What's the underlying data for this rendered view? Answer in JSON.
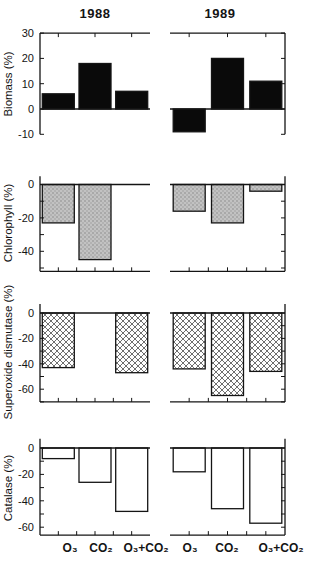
{
  "chart_data": {
    "type": "bar",
    "title": "",
    "columns": [
      "1988",
      "1989"
    ],
    "categories": [
      "O₃",
      "CO₂",
      "O₃+CO₂"
    ],
    "grid": false,
    "legend": null,
    "ink_color": "#141414",
    "rows": [
      {
        "ylabel": "Biomass (%)",
        "ylim": [
          -10,
          30
        ],
        "yticks": [
          30,
          20,
          10,
          0,
          -10
        ],
        "fill": "solid-black",
        "series": [
          {
            "name": "1988",
            "values": [
              6,
              18,
              7
            ]
          },
          {
            "name": "1989",
            "values": [
              -9,
              20,
              11
            ]
          }
        ]
      },
      {
        "ylabel": "Chlorophyll (%)",
        "ylim": [
          -52,
          5
        ],
        "yticks": [
          0,
          -20,
          -40
        ],
        "fill": "stipple-gray",
        "series": [
          {
            "name": "1988",
            "values": [
              -23,
              -45,
              0
            ]
          },
          {
            "name": "1989",
            "values": [
              -16,
              -23,
              -4
            ]
          }
        ]
      },
      {
        "ylabel": "Superoxide dismutase (%)",
        "ylim": [
          -70,
          7
        ],
        "yticks": [
          0,
          -20,
          -40,
          -60
        ],
        "fill": "crosshatch",
        "series": [
          {
            "name": "1988",
            "values": [
              -43,
              0,
              -47
            ]
          },
          {
            "name": "1989",
            "values": [
              -44,
              -65,
              -46
            ]
          }
        ]
      },
      {
        "ylabel": "Catalase (%)",
        "ylim": [
          -66,
          7
        ],
        "yticks": [
          0,
          -20,
          -40,
          -60
        ],
        "fill": "open-white",
        "series": [
          {
            "name": "1988",
            "values": [
              -8,
              -26,
              -48
            ]
          },
          {
            "name": "1989",
            "values": [
              -18,
              -46,
              -57
            ]
          }
        ]
      }
    ]
  }
}
